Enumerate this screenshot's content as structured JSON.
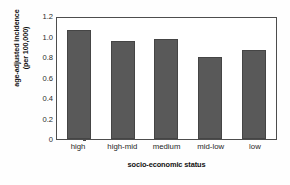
{
  "chart_data": {
    "type": "bar",
    "title": "",
    "xlabel": "socio-economic status",
    "ylabel_line1": "age-adjusted incidence",
    "ylabel_line2": "(per 100,000)",
    "categories": [
      "high",
      "high-mid",
      "medium",
      "mid-low",
      "low"
    ],
    "values": [
      1.06,
      0.955,
      0.98,
      0.8,
      0.87
    ],
    "ylim": [
      0,
      1.2
    ],
    "yticks": [
      "0",
      "0.2",
      "0.4",
      "0.6",
      "0.8",
      "1.0",
      "1.2"
    ],
    "ytick_values": [
      0,
      0.2,
      0.4,
      0.6,
      0.8,
      1.0,
      1.2
    ],
    "grid": false,
    "legend": "none",
    "bar_color": "#595959",
    "bar_edge_color": "#454545",
    "axis_color": "#4d4d4d",
    "background_color": "#ffffff"
  }
}
